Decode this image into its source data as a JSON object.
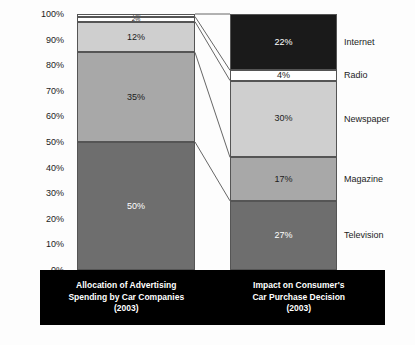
{
  "chart_data": {
    "type": "bar",
    "subtype": "stacked-percentage",
    "title": "",
    "xlabel": "",
    "ylabel": "",
    "ylim": [
      0,
      100
    ],
    "grid": false,
    "legend_position": "right",
    "categories": [
      "Allocation of Advertising Spending by Car Companies (2003)",
      "Impact on Consumer's Car Purchase Decision (2003)"
    ],
    "series": [
      {
        "name": "Television",
        "values": [
          50,
          27
        ]
      },
      {
        "name": "Magazine",
        "values": [
          35,
          17
        ]
      },
      {
        "name": "Newspaper",
        "values": [
          12,
          30
        ]
      },
      {
        "name": "Radio",
        "values": [
          2,
          4
        ]
      },
      {
        "name": "Internet",
        "values": [
          1,
          22
        ]
      }
    ],
    "y_ticks": [
      "0%",
      "10%",
      "20%",
      "30%",
      "40%",
      "50%",
      "60%",
      "70%",
      "80%",
      "90%",
      "100%"
    ]
  },
  "axis": {
    "ticks": [
      {
        "label": "100%",
        "value": 100
      },
      {
        "label": "90%",
        "value": 90
      },
      {
        "label": "80%",
        "value": 80
      },
      {
        "label": "70%",
        "value": 70
      },
      {
        "label": "60%",
        "value": 60
      },
      {
        "label": "50%",
        "value": 50
      },
      {
        "label": "40%",
        "value": 40
      },
      {
        "label": "30%",
        "value": 30
      },
      {
        "label": "20%",
        "value": 20
      },
      {
        "label": "10%",
        "value": 10
      },
      {
        "label": "0%",
        "value": 0
      }
    ]
  },
  "bars": {
    "left": {
      "segments": [
        {
          "name": "Internet",
          "label": "1%",
          "value": 1,
          "fill": "#ffffff",
          "text": "dark"
        },
        {
          "name": "Radio",
          "label": "2%",
          "value": 2,
          "fill": "#ffffff",
          "text": "dark"
        },
        {
          "name": "Newspaper",
          "label": "12%",
          "value": 12,
          "fill": "#cfcfcf",
          "text": "dark"
        },
        {
          "name": "Magazine",
          "label": "35%",
          "value": 35,
          "fill": "#a8a8a8",
          "text": "dark"
        },
        {
          "name": "Television",
          "label": "50%",
          "value": 50,
          "fill": "#6e6e6e",
          "text": "light"
        }
      ]
    },
    "right": {
      "segments": [
        {
          "name": "Internet",
          "label": "22%",
          "value": 22,
          "fill": "#1a1a1a",
          "text": "light"
        },
        {
          "name": "Radio",
          "label": "4%",
          "value": 4,
          "fill": "#ffffff",
          "text": "dark"
        },
        {
          "name": "Newspaper",
          "label": "30%",
          "value": 30,
          "fill": "#cfcfcf",
          "text": "dark"
        },
        {
          "name": "Magazine",
          "label": "17%",
          "value": 17,
          "fill": "#a8a8a8",
          "text": "dark"
        },
        {
          "name": "Television",
          "label": "27%",
          "value": 27,
          "fill": "#6e6e6e",
          "text": "light"
        }
      ]
    }
  },
  "legend": {
    "items": [
      {
        "label": "Internet"
      },
      {
        "label": "Radio"
      },
      {
        "label": "Newspaper"
      },
      {
        "label": "Magazine"
      },
      {
        "label": "Television"
      }
    ]
  },
  "captions": {
    "left": {
      "line1": "Allocation of Advertising",
      "line2": "Spending by Car Companies",
      "line3": "(2003)"
    },
    "right": {
      "line1": "Impact on Consumer's",
      "line2": "Car Purchase Decision",
      "line3": "(2003)"
    }
  },
  "colors": {
    "television": "#6e6e6e",
    "magazine": "#a8a8a8",
    "newspaper": "#cfcfcf",
    "radio": "#ffffff",
    "internet_left": "#ffffff",
    "internet_right": "#1a1a1a",
    "caption_band": "#000000",
    "outline": "#555555",
    "background": "#fdfdfd"
  }
}
